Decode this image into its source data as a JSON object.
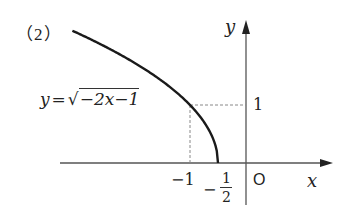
{
  "problem": {
    "label": "（2）"
  },
  "equation": {
    "lhs": "y",
    "equals": "=",
    "radical": "√",
    "radicand": "−2x−1"
  },
  "axes": {
    "x_label": "x",
    "y_label": "y",
    "origin_label": "O"
  },
  "ticks": {
    "x_minus_one": "−1",
    "x_minus_half_sign": "−",
    "x_minus_half_num": "1",
    "x_minus_half_den": "2",
    "y_one": "1"
  },
  "colors": {
    "curve": "#1a1a1a",
    "axis": "#555555",
    "guide": "#888888",
    "text": "#222222"
  },
  "chart_data": {
    "type": "line",
    "title": "",
    "function": "y = sqrt(-2x - 1)",
    "domain": [
      -3.1,
      -0.5
    ],
    "xlabel": "x",
    "ylabel": "y",
    "x_ticks": [
      -1,
      -0.5,
      0
    ],
    "y_ticks": [
      1
    ],
    "marked_points": [
      {
        "x": -1,
        "y": 1,
        "guides": "dashed"
      },
      {
        "x": -0.5,
        "y": 0
      }
    ],
    "series": [
      {
        "name": "y = √(−2x−1)",
        "x": [
          -3.1,
          -2.5,
          -2.0,
          -1.5,
          -1.0,
          -0.75,
          -0.6,
          -0.5
        ],
        "values": [
          2.28,
          2.0,
          1.73,
          1.41,
          1.0,
          0.71,
          0.45,
          0.0
        ]
      }
    ],
    "grid": false
  }
}
